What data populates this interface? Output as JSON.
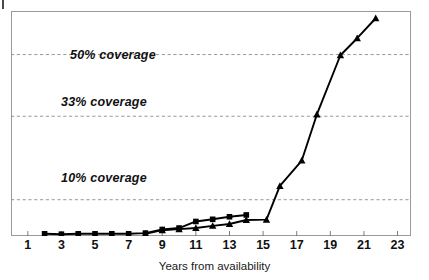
{
  "chart_data": {
    "type": "line",
    "title": "",
    "subtitle": "",
    "xlabel": "Years from availability",
    "ylabel": "",
    "xlim": [
      0,
      23.8
    ],
    "ylim": [
      0,
      62
    ],
    "grid": true,
    "grid_axis": "y",
    "grid_style": "dashed",
    "legend": "none",
    "xticks": [
      1,
      3,
      5,
      7,
      9,
      11,
      13,
      15,
      17,
      19,
      21,
      23
    ],
    "xtick_labels": [
      "1",
      "3",
      "5",
      "7",
      "9",
      "11",
      "13",
      "15",
      "17",
      "19",
      "21",
      "23"
    ],
    "annotations": [
      {
        "text": "50% coverage",
        "y": 50,
        "kind": "gridline-label"
      },
      {
        "text": "33% coverage",
        "y": 33,
        "kind": "gridline-label"
      },
      {
        "text": "10% coverage",
        "y": 10,
        "kind": "gridline-label"
      }
    ],
    "hlines": [
      {
        "label": "50% coverage",
        "value": 50
      },
      {
        "label": "33% coverage",
        "value": 33
      },
      {
        "label": "10% coverage",
        "value": 10
      }
    ],
    "series": [
      {
        "name": "square-series",
        "marker": "square",
        "color": "#000000",
        "x": [
          2,
          3,
          4,
          5,
          6,
          7,
          8,
          9,
          10,
          11,
          12,
          13,
          14
        ],
        "y": [
          0.6,
          0.5,
          0.6,
          0.6,
          0.6,
          0.6,
          0.8,
          1.8,
          2.2,
          4.0,
          4.6,
          5.3,
          5.8
        ]
      },
      {
        "name": "triangle-series",
        "marker": "triangle",
        "color": "#000000",
        "x": [
          8,
          9,
          10,
          11,
          12,
          13,
          14,
          15.2,
          16,
          17.3,
          18.2,
          19.6,
          20.6,
          21.7
        ],
        "y": [
          0.6,
          1.6,
          1.9,
          2.2,
          2.8,
          3.3,
          4.4,
          4.5,
          13.8,
          20.8,
          33.5,
          49.8,
          54.5,
          60.0
        ]
      }
    ]
  },
  "labels": {
    "coverage_50": "50% coverage",
    "coverage_33": "33% coverage",
    "coverage_10": "10% coverage",
    "x_axis_title": "Years from availability"
  },
  "colors": {
    "line": "#000000",
    "marker": "#000000",
    "gridline": "#8c8c8c",
    "frame": "#9a9a9a",
    "axis": "#6f6f6f",
    "text": "#111111",
    "background": "#ffffff"
  }
}
